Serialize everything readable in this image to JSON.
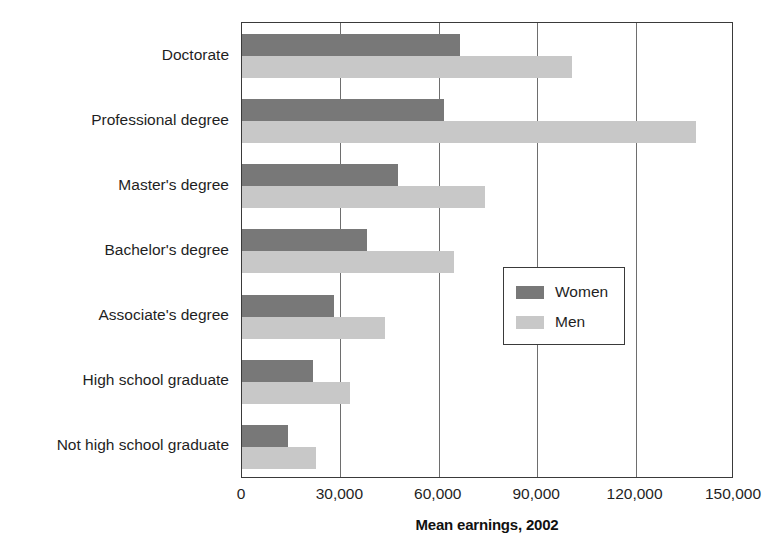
{
  "chart_data": {
    "type": "bar",
    "orientation": "horizontal",
    "title": "",
    "xlabel": "Mean earnings, 2002",
    "ylabel": "",
    "xlim": [
      0,
      150000
    ],
    "ylim": null,
    "grid": true,
    "xticks": [
      0,
      30000,
      60000,
      90000,
      120000,
      150000
    ],
    "xticklabels": [
      "0",
      "30,000",
      "60,000",
      "90,000",
      "120,000",
      "150,000"
    ],
    "categories": [
      "Doctorate",
      "Professional degree",
      "Master's degree",
      "Bachelor's degree",
      "Associate's degree",
      "High school graduate",
      "Not high school graduate"
    ],
    "series": [
      {
        "name": "Women",
        "color": "#787878",
        "values": [
          66500,
          61500,
          47500,
          38000,
          28000,
          21500,
          14000
        ]
      },
      {
        "name": "Men",
        "color": "#c8c8c8",
        "values": [
          100500,
          138500,
          74000,
          64500,
          43500,
          33000,
          22500
        ]
      }
    ],
    "legend": {
      "position": "center-right",
      "entries": [
        {
          "label": "Women",
          "color": "#787878"
        },
        {
          "label": "Men",
          "color": "#c8c8c8"
        }
      ]
    }
  },
  "style": {
    "axis_color": "#3a3a3a",
    "grid_color": "#6e6e6e",
    "text_color": "#1f1f1f",
    "background": "#ffffff"
  }
}
